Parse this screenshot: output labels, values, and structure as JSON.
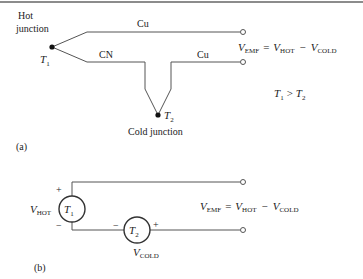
{
  "figure_a": {
    "hot_junction_label_1": "Hot",
    "hot_junction_label_2": "junction",
    "t1": "T",
    "t1_sub": "1",
    "wire_top_label": "Cu",
    "wire_bottom_label": "CN",
    "wire_bottom_right_label": "Cu",
    "t2": "T",
    "t2_sub": "2",
    "cold_junction_label": "Cold junction",
    "equation": {
      "v": "V",
      "emf": "EMF",
      "eq": "=",
      "hot": "HOT",
      "minus": "−",
      "cold": "COLD"
    },
    "condition": {
      "a": "T",
      "a_sub": "1",
      "op": ">",
      "b": "T",
      "b_sub": "2"
    },
    "caption": "(a)"
  },
  "figure_b": {
    "plus_top": "+",
    "minus_bottom": "−",
    "v_hot_v": "V",
    "v_hot_sub": "HOT",
    "source1": "T",
    "source1_sub": "1",
    "source2": "T",
    "source2_sub": "2",
    "minus_left": "−",
    "plus_right": "+",
    "v_cold_v": "V",
    "v_cold_sub": "COLD",
    "equation": {
      "v": "V",
      "emf": "EMF",
      "eq": "=",
      "hot": "HOT",
      "minus": "−",
      "cold": "COLD"
    },
    "caption": "(b)"
  }
}
